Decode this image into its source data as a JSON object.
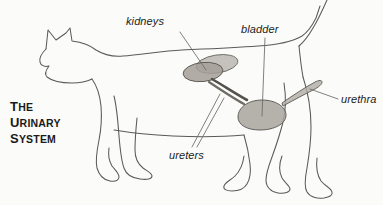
{
  "figure": {
    "background_color": "#fbfbf9",
    "ink_color": "#4a4a4a",
    "organ_fill_color": "#a9a59e",
    "title": {
      "lines": [
        {
          "cap": "T",
          "rest": "HE"
        },
        {
          "cap": "U",
          "rest": "RINARY"
        },
        {
          "cap": "S",
          "rest": "YSTEM"
        }
      ]
    },
    "labels": [
      {
        "id": "kidneys",
        "text": "kidneys"
      },
      {
        "id": "bladder",
        "text": "bladder"
      },
      {
        "id": "urethra",
        "text": "urethra"
      },
      {
        "id": "ureters",
        "text": "ureters"
      }
    ],
    "organs": [
      {
        "id": "kidney-left",
        "name": "kidney"
      },
      {
        "id": "kidney-right",
        "name": "kidney"
      },
      {
        "id": "ureter-upper",
        "name": "ureter"
      },
      {
        "id": "ureter-lower",
        "name": "ureter"
      },
      {
        "id": "bladder",
        "name": "bladder"
      },
      {
        "id": "urethra",
        "name": "urethra"
      }
    ]
  }
}
